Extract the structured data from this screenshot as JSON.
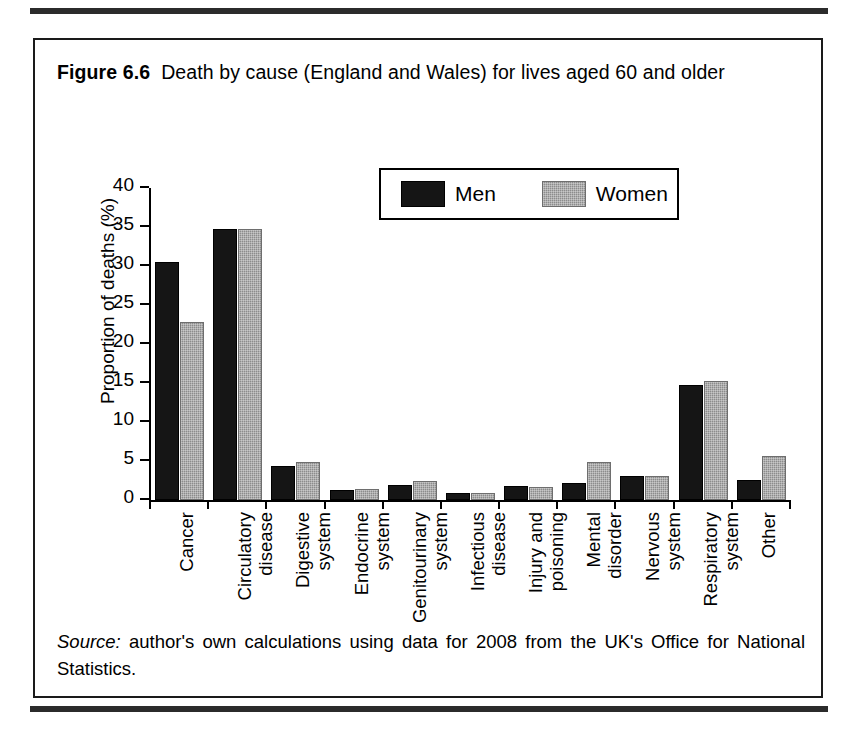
{
  "figure": {
    "number_label": "Figure 6.6",
    "caption": "Death by cause (England and Wales) for lives aged 60 and older",
    "source_prefix": "Source:",
    "source_text": " author's own calculations using data for 2008 from the UK's Office for National Statistics."
  },
  "colors": {
    "men": "#151515",
    "women": "#8c8c8c",
    "axis": "#000000",
    "frame": "#1a1a1a"
  },
  "chart_data": {
    "type": "bar",
    "title": "Death by cause (England and Wales) for lives aged 60 and older",
    "xlabel": "",
    "ylabel": "Proportion of deaths (%)",
    "ylim": [
      0,
      40
    ],
    "yticks": [
      0,
      5,
      10,
      15,
      20,
      25,
      30,
      35,
      40
    ],
    "ytick_labels": [
      "0",
      "5",
      "10",
      "15",
      "20",
      "25",
      "30",
      "35",
      "40"
    ],
    "grid": false,
    "legend_position": "upper center",
    "categories": [
      "Cancer",
      "Circulatory disease",
      "Digestive system",
      "Endocrine system",
      "Genitourinary system",
      "Infectious disease",
      "Injury and poisoning",
      "Mental disorder",
      "Nervous system",
      "Respiratory system",
      "Other"
    ],
    "category_lines": [
      [
        "Cancer",
        ""
      ],
      [
        "Circulatory",
        "disease"
      ],
      [
        "Digestive",
        "system"
      ],
      [
        "Endocrine",
        "system"
      ],
      [
        "Genitourinary",
        "system"
      ],
      [
        "Infectious",
        "disease"
      ],
      [
        "Injury and",
        "poisoning"
      ],
      [
        "Mental",
        "disorder"
      ],
      [
        "Nervous",
        "system"
      ],
      [
        "Respiratory",
        "system"
      ],
      [
        "Other",
        ""
      ]
    ],
    "series": [
      {
        "name": "Men",
        "values": [
          30.5,
          34.8,
          4.3,
          1.3,
          1.9,
          0.9,
          1.8,
          2.2,
          3.1,
          14.7,
          2.6
        ]
      },
      {
        "name": "Women",
        "values": [
          22.8,
          34.7,
          4.9,
          1.4,
          2.4,
          0.9,
          1.7,
          4.9,
          3.1,
          15.2,
          5.7
        ]
      }
    ]
  }
}
